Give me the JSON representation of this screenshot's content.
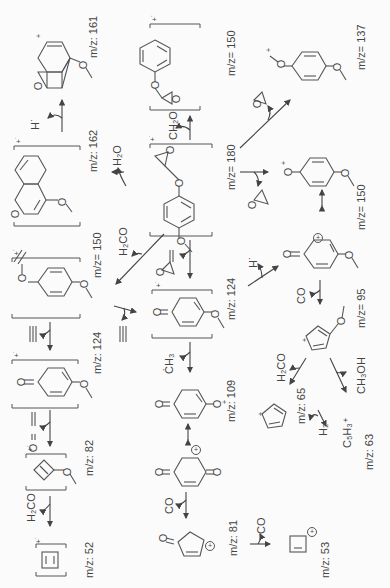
{
  "diagram": {
    "type": "mass-spec-fragmentation-scheme",
    "orientation": "rotated-90-ccw",
    "colors": {
      "line": "#555555",
      "text": "#444444",
      "background": "#fbfbfb"
    },
    "species": [
      {
        "id": "parent",
        "mz": "m/z= 180",
        "desc": "glycidyl 4-methoxyphenyl ether radical cation"
      },
      {
        "id": "chromene",
        "mz": "m/z: 162",
        "desc": "6-methoxy-2H-chromene radical cation"
      },
      {
        "id": "chromenylium",
        "mz": "m/z: 161",
        "desc": "6-methoxy-chromenylium"
      },
      {
        "id": "phenyl_glycidyl",
        "mz": "m/z= 150",
        "desc": "glycidyl phenyl ether radical cation"
      },
      {
        "id": "dimethoxy_oxonium",
        "mz": "m/z= 137",
        "desc": "4-methoxyphenyl-O-methyl oxonium"
      },
      {
        "id": "vinyl_ether",
        "mz": "m/z= 150",
        "desc": "4-methoxyphenyl vinyl ether radical cation"
      },
      {
        "id": "quinone_124a",
        "mz": "m/z: 124",
        "desc": "methoxy cyclohexadienone radical cation (from vinyl ether)"
      },
      {
        "id": "quinone_124b",
        "mz": "m/z: 124",
        "desc": "methoxy cyclohexadienone radical cation (from parent)"
      },
      {
        "id": "phenoxy_123",
        "mz": "m/z: 123",
        "desc": "4-methoxyphenoxy cation"
      },
      {
        "id": "quinone_109",
        "mz": "m/z: 109",
        "desc": "benzoquinone cation"
      },
      {
        "id": "cyclobutadiene_82",
        "mz": "m/z: 82",
        "desc": "methoxy cyclobutadiene radical cation"
      },
      {
        "id": "cyclobutadiene_52",
        "mz": "m/z: 52",
        "desc": "cyclobutadiene radical cation"
      },
      {
        "id": "methoxy_cp_95",
        "mz": "m/z= 95",
        "desc": "methoxy cyclopentadienyl cation"
      },
      {
        "id": "cp_65",
        "mz": "m/z: 65",
        "desc": "cyclopentadienyl cation"
      },
      {
        "id": "c5h3_63",
        "mz": "m/z: 63",
        "desc": "C5H3+"
      },
      {
        "id": "cyclopentenone_81",
        "mz": "m/z: 81",
        "desc": "cyclopentenone cation"
      },
      {
        "id": "cyclobutenyl_53",
        "mz": "m/z: 53",
        "desc": "cyclobutenyl cation"
      }
    ],
    "losses": {
      "h2o": "H₂O",
      "h_radical": "H˙",
      "ch2o": "CH₂O",
      "h2co_a": "H₂CO",
      "h2co_b": "H₂CO",
      "h2co_c": "H₂CO",
      "acetylene_a": "≡",
      "acetylene_b": "≡",
      "ketene": "O=C=",
      "ch3": "ĊH₃",
      "h_radical_b": "H˙",
      "co_a": "CO",
      "co_b": "CO",
      "co_c": "CO",
      "ch3oh": "CH₃OH",
      "h2": "H₂",
      "c5h3": "C₅H₃⁺",
      "epoxide_radical": "oxiranyl˙",
      "allene_oxide": "methylene-oxirane"
    },
    "atoms": {
      "O": "O",
      "plus": "+",
      "radical_cation": "+˙",
      "circled_plus": "+"
    }
  }
}
